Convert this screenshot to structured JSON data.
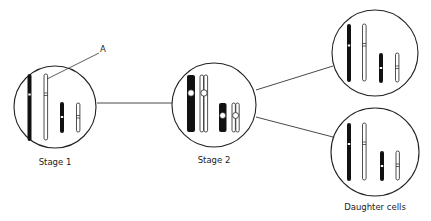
{
  "diagram": {
    "stages": [
      {
        "id": "stage1",
        "label": "Stage 1"
      },
      {
        "id": "stage2",
        "label": "Stage 2"
      },
      {
        "id": "daughter",
        "label": "Daughter cells"
      }
    ],
    "annotation": {
      "label": "A"
    },
    "colors": {
      "stroke": "#1a1a1a",
      "fill_dark": "#111111",
      "fill_light": "#ffffff"
    }
  }
}
